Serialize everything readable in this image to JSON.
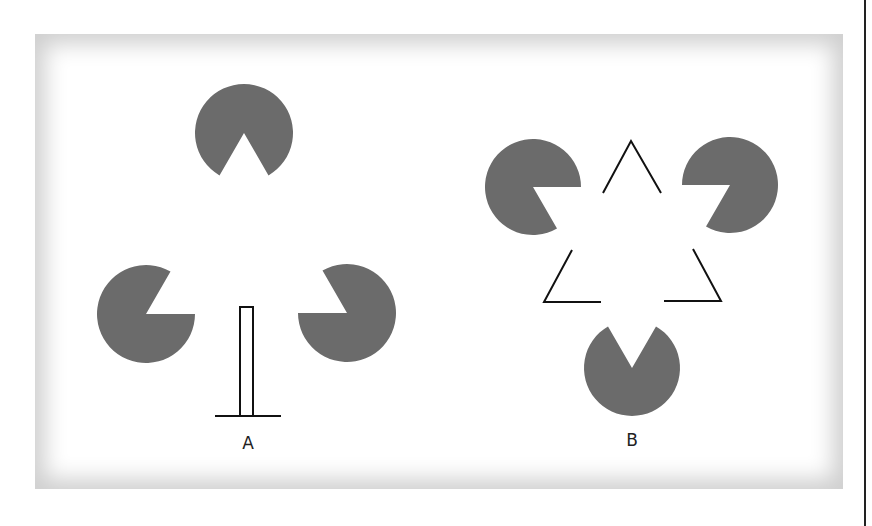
{
  "figure": {
    "panels": [
      {
        "id": "A",
        "label": "A",
        "description": "Three pacman inducers with vertical post and base line"
      },
      {
        "id": "B",
        "label": "B",
        "description": "Three pacman inducers with three V-shaped line corners forming illusory triangles"
      }
    ],
    "colors": {
      "inducer_fill": "#6b6b6b",
      "line_stroke": "#111111",
      "frame_shadow": "#cfcfcf",
      "background": "#ffffff"
    }
  }
}
